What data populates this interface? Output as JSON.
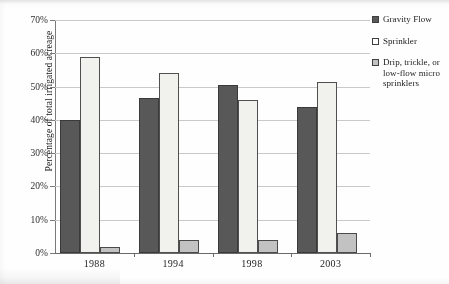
{
  "chart_data": {
    "type": "bar",
    "title": "",
    "subtitle": "",
    "xlabel": "",
    "ylabel": "Percentage of total irrigated acreage",
    "categories": [
      "1988",
      "1994",
      "1998",
      "2003"
    ],
    "ylim": [
      0,
      70
    ],
    "ytick_labels": [
      "0%",
      "10%",
      "20%",
      "30%",
      "40%",
      "50%",
      "60%",
      "70%"
    ],
    "ytick_values": [
      0,
      10,
      20,
      30,
      40,
      50,
      60,
      70
    ],
    "grid": true,
    "legend_position": "right",
    "value_suffix": "%",
    "series": [
      {
        "name": "Gravity Flow",
        "color": "#585858",
        "values": [
          40,
          46.5,
          50.5,
          44
        ]
      },
      {
        "name": "Sprinkler",
        "color": "#f1f1ee",
        "values": [
          59,
          54,
          46,
          51.5
        ]
      },
      {
        "name": "Drip, trickle, or low-flow micro sprinklers",
        "color": "#c2c2c2",
        "values": [
          1.7,
          4,
          4,
          6
        ]
      }
    ]
  },
  "legend": {
    "entries": [
      {
        "label": "Gravity Flow",
        "swatch": "dark-gray-square"
      },
      {
        "label": "Sprinkler",
        "swatch": "white-square"
      },
      {
        "label": "Drip, trickle, or low-flow micro sprinklers",
        "swatch": "light-gray-square"
      }
    ]
  }
}
